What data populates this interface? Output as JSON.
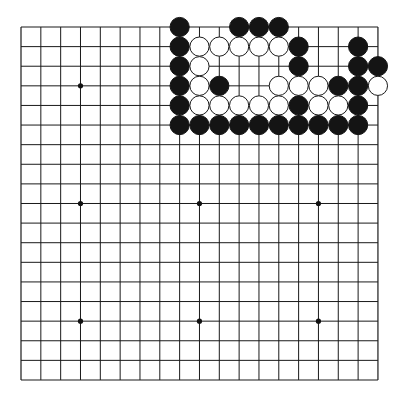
{
  "board": {
    "size": 19,
    "origin": {
      "x": 21,
      "y": 27
    },
    "spacing": {
      "x": 19.83,
      "y": 19.61
    },
    "stone_radius": 9.6,
    "colors": {
      "line": "#1a1a1a",
      "black": "#141414",
      "white": "#ffffff",
      "background": "#ffffff"
    },
    "star_points": [
      [
        3,
        3
      ],
      [
        9,
        3
      ],
      [
        15,
        3
      ],
      [
        3,
        9
      ],
      [
        9,
        9
      ],
      [
        15,
        9
      ],
      [
        3,
        15
      ],
      [
        9,
        15
      ],
      [
        15,
        15
      ]
    ],
    "stones": [
      {
        "color": "black",
        "col": 8,
        "row": 0
      },
      {
        "color": "black",
        "col": 11,
        "row": 0
      },
      {
        "color": "black",
        "col": 12,
        "row": 0
      },
      {
        "color": "black",
        "col": 13,
        "row": 0
      },
      {
        "color": "black",
        "col": 8,
        "row": 1
      },
      {
        "color": "white",
        "col": 9,
        "row": 1
      },
      {
        "color": "white",
        "col": 10,
        "row": 1
      },
      {
        "color": "white",
        "col": 11,
        "row": 1
      },
      {
        "color": "white",
        "col": 12,
        "row": 1
      },
      {
        "color": "white",
        "col": 13,
        "row": 1
      },
      {
        "color": "black",
        "col": 14,
        "row": 1
      },
      {
        "color": "black",
        "col": 17,
        "row": 1
      },
      {
        "color": "black",
        "col": 8,
        "row": 2
      },
      {
        "color": "white",
        "col": 9,
        "row": 2
      },
      {
        "color": "black",
        "col": 14,
        "row": 2
      },
      {
        "color": "black",
        "col": 17,
        "row": 2
      },
      {
        "color": "black",
        "col": 18,
        "row": 2
      },
      {
        "color": "black",
        "col": 8,
        "row": 3
      },
      {
        "color": "white",
        "col": 9,
        "row": 3
      },
      {
        "color": "black",
        "col": 10,
        "row": 3
      },
      {
        "color": "white",
        "col": 13,
        "row": 3
      },
      {
        "color": "white",
        "col": 14,
        "row": 3
      },
      {
        "color": "white",
        "col": 15,
        "row": 3
      },
      {
        "color": "black",
        "col": 16,
        "row": 3
      },
      {
        "color": "black",
        "col": 17,
        "row": 3
      },
      {
        "color": "white",
        "col": 18,
        "row": 3
      },
      {
        "color": "black",
        "col": 8,
        "row": 4
      },
      {
        "color": "white",
        "col": 9,
        "row": 4
      },
      {
        "color": "white",
        "col": 10,
        "row": 4
      },
      {
        "color": "white",
        "col": 11,
        "row": 4
      },
      {
        "color": "white",
        "col": 12,
        "row": 4
      },
      {
        "color": "white",
        "col": 13,
        "row": 4
      },
      {
        "color": "black",
        "col": 14,
        "row": 4
      },
      {
        "color": "white",
        "col": 15,
        "row": 4
      },
      {
        "color": "white",
        "col": 16,
        "row": 4
      },
      {
        "color": "black",
        "col": 17,
        "row": 4
      },
      {
        "color": "black",
        "col": 8,
        "row": 5
      },
      {
        "color": "black",
        "col": 9,
        "row": 5
      },
      {
        "color": "black",
        "col": 10,
        "row": 5
      },
      {
        "color": "black",
        "col": 11,
        "row": 5
      },
      {
        "color": "black",
        "col": 12,
        "row": 5
      },
      {
        "color": "black",
        "col": 13,
        "row": 5
      },
      {
        "color": "black",
        "col": 14,
        "row": 5
      },
      {
        "color": "black",
        "col": 15,
        "row": 5
      },
      {
        "color": "black",
        "col": 16,
        "row": 5
      },
      {
        "color": "black",
        "col": 17,
        "row": 5
      }
    ]
  }
}
